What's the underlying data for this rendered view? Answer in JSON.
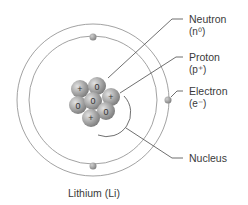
{
  "diagram": {
    "title": "Lithium (Li)",
    "labels": {
      "neutron": {
        "name": "Neutron",
        "symbol": "(n⁰)"
      },
      "proton": {
        "name": "Proton",
        "symbol": "(p⁺)"
      },
      "electron": {
        "name": "Electron",
        "symbol": "(e⁻)"
      },
      "nucleus": {
        "name": "Nucleus"
      }
    },
    "nucleus_particles": [
      {
        "type": "proton",
        "mark": "+"
      },
      {
        "type": "neutron",
        "mark": "0"
      },
      {
        "type": "proton",
        "mark": "+"
      },
      {
        "type": "neutron",
        "mark": "0"
      },
      {
        "type": "neutron",
        "mark": "0"
      },
      {
        "type": "neutron",
        "mark": "0"
      },
      {
        "type": "proton",
        "mark": "+"
      }
    ],
    "electron_count": 3,
    "colors": {
      "orbit": "#8a8a8a",
      "particle": "#9a9a9a",
      "particle_highlight": "#d8d8d8",
      "leader_line": "#4a4a4a",
      "text": "#3a3a3a"
    }
  }
}
